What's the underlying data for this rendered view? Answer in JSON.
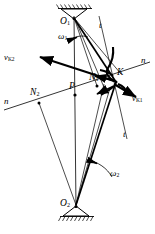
{
  "figure": {
    "background_color": "#ffffff",
    "stroke_color": "#000000",
    "width": 155,
    "height": 234
  },
  "labels": {
    "pivot_top": "O",
    "pivot_top_sub": "1",
    "pivot_bottom": "O",
    "pivot_bottom_sub": "2",
    "contact_point": "K",
    "pitch_point": "P",
    "normal_foot_1": "N",
    "normal_foot_1_sub": "1",
    "normal_foot_2": "N",
    "normal_foot_2_sub": "2",
    "omega_1": "ω",
    "omega_1_sub": "1",
    "omega_2": "ω",
    "omega_2_sub": "2",
    "velocity_k1": "v",
    "velocity_k1_sub": "K1",
    "velocity_k2": "v",
    "velocity_k2_sub": "K2",
    "normal_line_left": "n",
    "normal_line_right": "n",
    "tangent_upper": "t",
    "tangent_lower": "t"
  },
  "geometry": {
    "pivot_top": [
      74,
      18
    ],
    "pivot_bottom": [
      76,
      206
    ],
    "contact_point": [
      116,
      82
    ],
    "pitch_point": [
      75,
      95
    ],
    "normal_foot_1": [
      97,
      86
    ],
    "normal_foot_2": [
      39,
      103
    ],
    "normal_line_start": [
      4,
      110
    ],
    "normal_line_end": [
      150,
      62
    ],
    "centerline_start": [
      74,
      12
    ],
    "centerline_end": [
      76,
      214
    ],
    "velocity_k1_tip": [
      139,
      98
    ],
    "velocity_k2_tip": [
      40,
      57
    ]
  },
  "elements": {
    "ground_hatch_top": "ground-support-hatching-top",
    "ground_hatch_bottom": "ground-support-hatching-bottom",
    "tooth_profile_1": "upper-tooth-flank-curve",
    "tooth_profile_2": "lower-tooth-flank-curve",
    "arc_omega_1": "angular-velocity-arc-1",
    "arc_omega_2": "angular-velocity-arc-2"
  }
}
